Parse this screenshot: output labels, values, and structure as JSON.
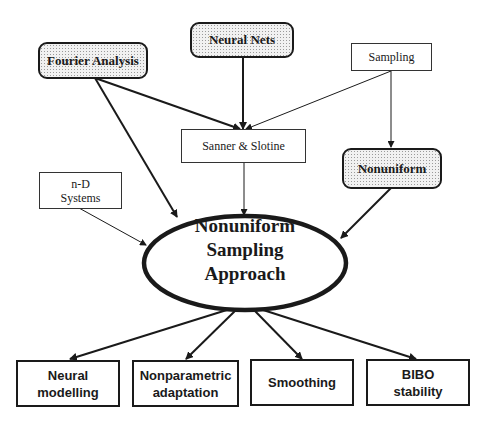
{
  "diagram": {
    "center": {
      "label_lines": [
        "Nonuniform",
        "Sampling",
        "Approach"
      ]
    },
    "inputs": [
      {
        "id": "fourier",
        "label": "Fourier Analysis",
        "style": "stippled-rounded"
      },
      {
        "id": "neural-nets",
        "label": "Neural Nets",
        "style": "stippled-rounded"
      },
      {
        "id": "sampling",
        "label": "Sampling",
        "style": "plain"
      },
      {
        "id": "sanner",
        "label": "Sanner & Slotine",
        "style": "plain"
      },
      {
        "id": "nonuniform",
        "label": "Nonuniform",
        "style": "stippled-rounded"
      },
      {
        "id": "nd-systems",
        "label_lines": [
          "n-D",
          "Systems"
        ],
        "style": "plain"
      }
    ],
    "outputs": [
      {
        "id": "neural-modelling",
        "label_lines": [
          "Neural",
          "modelling"
        ]
      },
      {
        "id": "nonparametric",
        "label_lines": [
          "Nonparametric",
          "adaptation"
        ]
      },
      {
        "id": "smoothing",
        "label_lines": [
          "Smoothing"
        ]
      },
      {
        "id": "bibo",
        "label_lines": [
          "BIBO",
          "stability"
        ]
      }
    ],
    "edges": [
      {
        "from": "Fourier Analysis",
        "to": "Sanner & Slotine"
      },
      {
        "from": "Neural Nets",
        "to": "Sanner & Slotine"
      },
      {
        "from": "Sampling",
        "to": "Sanner & Slotine"
      },
      {
        "from": "Sampling",
        "to": "Nonuniform"
      },
      {
        "from": "Fourier Analysis",
        "to": "Nonuniform Sampling Approach"
      },
      {
        "from": "Sanner & Slotine",
        "to": "Nonuniform Sampling Approach"
      },
      {
        "from": "Nonuniform",
        "to": "Nonuniform Sampling Approach"
      },
      {
        "from": "n-D Systems",
        "to": "Nonuniform Sampling Approach"
      },
      {
        "from": "Nonuniform Sampling Approach",
        "to": "Neural modelling"
      },
      {
        "from": "Nonuniform Sampling Approach",
        "to": "Nonparametric adaptation"
      },
      {
        "from": "Nonuniform Sampling Approach",
        "to": "Smoothing"
      },
      {
        "from": "Nonuniform Sampling Approach",
        "to": "BIBO stability"
      }
    ],
    "colors": {
      "ink": "#1a1a1a",
      "stipple_fill": "#f1f1f1",
      "background": "#ffffff"
    }
  }
}
